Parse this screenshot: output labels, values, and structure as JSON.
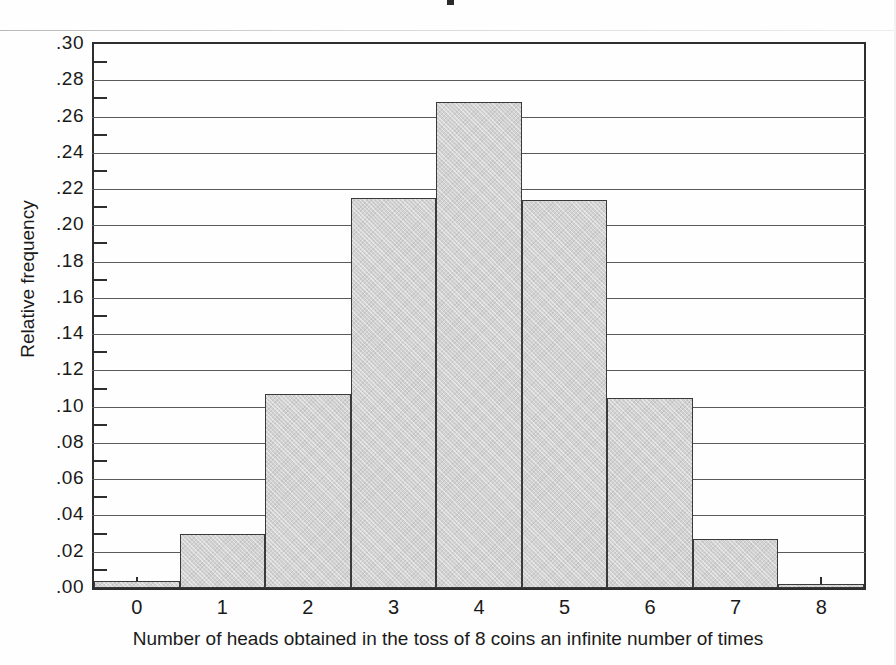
{
  "chart_data": {
    "type": "bar",
    "title": "",
    "xlabel": "Number of heads obtained in the toss of 8 coins an infinite number of times",
    "ylabel": "Relative frequency",
    "categories": [
      "0",
      "1",
      "2",
      "3",
      "4",
      "5",
      "6",
      "7",
      "8"
    ],
    "values": [
      0.004,
      0.03,
      0.107,
      0.215,
      0.268,
      0.214,
      0.105,
      0.027,
      0.002
    ],
    "ylim": [
      0.0,
      0.3
    ],
    "xlim": [
      -0.5,
      8.5
    ],
    "ytick_labels": [
      ".00",
      ".02",
      ".04",
      ".06",
      ".08",
      ".10",
      ".12",
      ".14",
      ".16",
      ".18",
      ".20",
      ".22",
      ".24",
      ".26",
      ".28",
      ".30"
    ],
    "ytick_values": [
      0.0,
      0.02,
      0.04,
      0.06,
      0.08,
      0.1,
      0.12,
      0.14,
      0.16,
      0.18,
      0.2,
      0.22,
      0.24,
      0.26,
      0.28,
      0.3
    ],
    "minor_tick_values": [
      0.01,
      0.03,
      0.05,
      0.07,
      0.09,
      0.11,
      0.13,
      0.15,
      0.17,
      0.19,
      0.21,
      0.23,
      0.25,
      0.27,
      0.29
    ],
    "grid": "horizontal-major",
    "legend": "none",
    "bar_fill_color": "#d2d2d2",
    "bar_edge_color": "#3a3a3a",
    "grid_color": "#5a5a5a",
    "axis_color": "#2e2e2e",
    "background_color": "#ffffff"
  }
}
